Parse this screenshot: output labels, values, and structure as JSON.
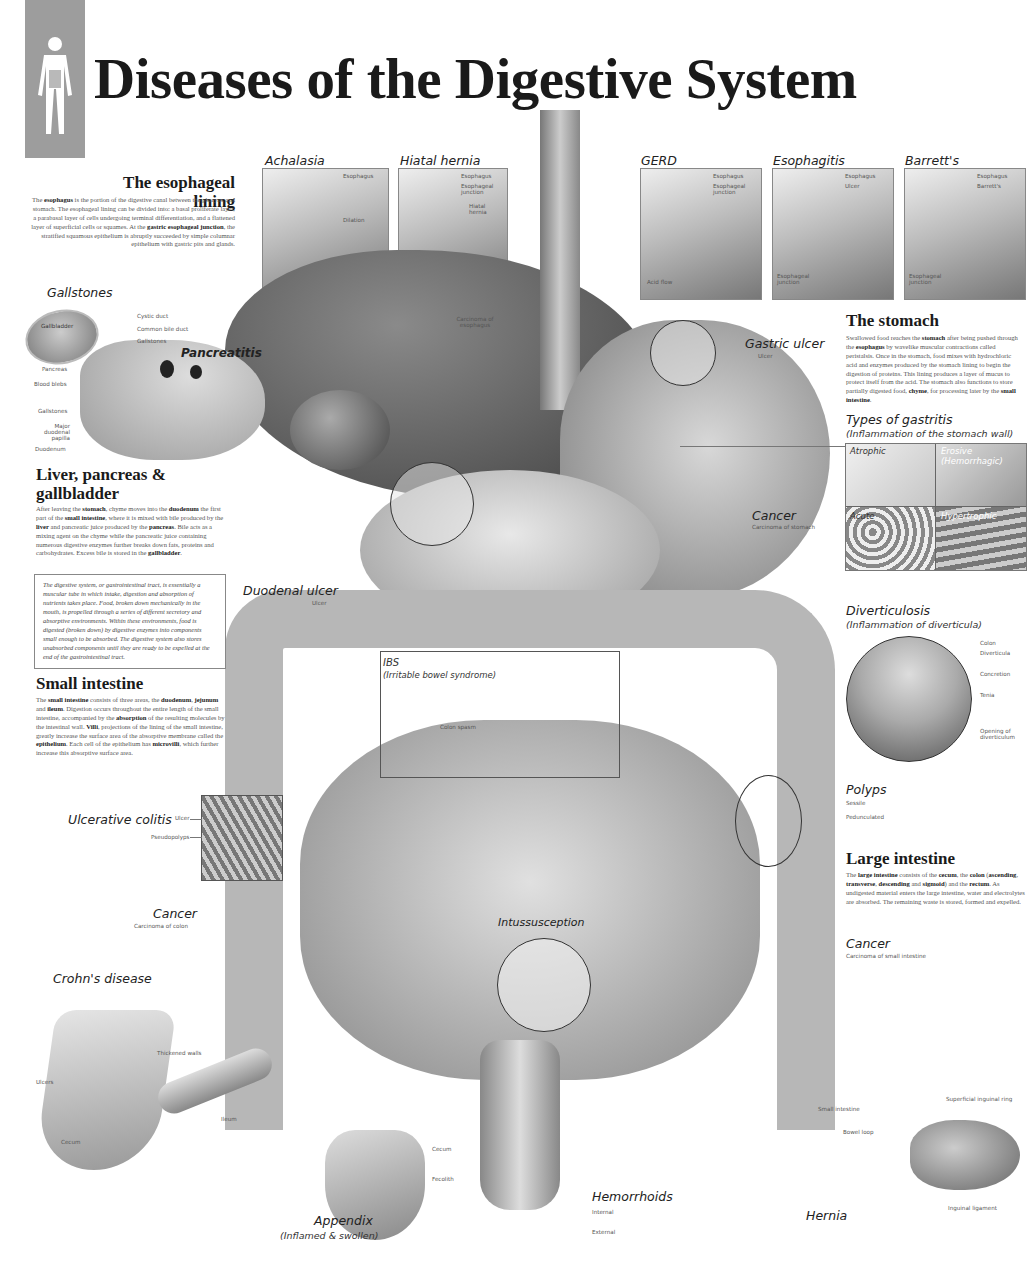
{
  "header": {
    "title": "Diseases of the Digestive System",
    "logo_icon": "human-body-silhouette-icon"
  },
  "esophageal_lining": {
    "heading": "The esophageal lining",
    "body_parts": [
      {
        "t": "The "
      },
      {
        "b": "esophagus"
      },
      {
        "t": " is the portion of the digestive canal between the pharynx and stomach. The esophageal lining can be divided into: a basal proliferate layer, a parabasal layer of cells undergoing terminal differentiation, and a flattened layer of superficial cells or squames. At the "
      },
      {
        "b": "gastric esophageal junction"
      },
      {
        "t": ", the stratified squamous epithelium is abruptly succeeded by simple columnar epithelium with gastric pits and glands."
      }
    ]
  },
  "top_panels": [
    {
      "title": "Achalasia",
      "labels": [
        "Esophagus",
        "Dilation",
        "Muscle constriction",
        "Esophageal junction"
      ]
    },
    {
      "title": "Hiatal hernia",
      "labels": [
        "Esophagus",
        "Esophageal junction",
        "Hiatal hernia"
      ]
    },
    {
      "title": "GERD",
      "labels": [
        "Esophagus",
        "Esophageal junction",
        "Acid flow"
      ]
    },
    {
      "title": "Esophagitis",
      "labels": [
        "Esophagus",
        "Ulcer",
        "Esophageal junction"
      ]
    },
    {
      "title": "Barrett's",
      "labels": [
        "Esophagus",
        "Barrett's",
        "Esophageal junction"
      ]
    }
  ],
  "gallstones": {
    "title": "Gallstones",
    "pancreatitis": "Pancreatitis",
    "labels": {
      "gallbladder": "Gallbladder",
      "cystic_duct": "Cystic duct",
      "common_bile_duct": "Common bile duct",
      "gallstones_top": "Gallstones",
      "pancreas": "Pancreas",
      "blood_blebs": "Blood blebs",
      "gallstones_bottom": "Gallstones",
      "papilla": "Major duodenal papilla",
      "duodenum": "Duodenum"
    }
  },
  "liver_section": {
    "heading": "Liver, pancreas & gallbladder",
    "body_parts": [
      {
        "t": "After leaving the "
      },
      {
        "b": "stomach"
      },
      {
        "t": ", chyme moves into the "
      },
      {
        "b": "duodenum"
      },
      {
        "t": " the first part of the "
      },
      {
        "b": "small intestine"
      },
      {
        "t": ", where it is mixed with bile produced by the "
      },
      {
        "b": "liver"
      },
      {
        "t": " and pancreatic juice produced by the "
      },
      {
        "b": "pancreas"
      },
      {
        "t": ". Bile acts as a mixing agent on the chyme while the pancreatic juice containing numerous digestive enzymes further breaks down fats, proteins and carbohydrates. Excess bile is stored in the "
      },
      {
        "b": "gallbladder"
      },
      {
        "t": "."
      }
    ],
    "boxed_note": "The digestive system, or gastrointestinal tract, is essentially a muscular tube in which intake, digestion and absorption of nutrients takes place. Food, broken down mechanically in the mouth, is propelled through a series of different secretory and absorptive environments. Within these environments, food is digested (broken down) by digestive enzymes into components small enough to be absorbed. The digestive system also stores unabsorbed components until they are ready to be expelled at the end of the gastrointestinal tract."
  },
  "small_intestine": {
    "heading": "Small intestine",
    "body_parts": [
      {
        "t": "The "
      },
      {
        "b": "small intestine"
      },
      {
        "t": " consists of three areas, the "
      },
      {
        "b": "duodenum"
      },
      {
        "t": ", "
      },
      {
        "b": "jejunum"
      },
      {
        "t": " and "
      },
      {
        "b": "ileum"
      },
      {
        "t": ". Digestion occurs throughout the entire length of the small intestine, accompanied by the "
      },
      {
        "b": "absorption"
      },
      {
        "t": " of the resulting molecules by the intestinal wall. "
      },
      {
        "b": "Villi"
      },
      {
        "t": ", projections of the lining of the small intestine, greatly increase the surface area of the absorptive membrane called the "
      },
      {
        "b": "epithelium"
      },
      {
        "t": ". Each cell of the epithelium has "
      },
      {
        "b": "microvilli"
      },
      {
        "t": ", which further increase this absorptive surface area."
      }
    ]
  },
  "stomach": {
    "heading": "The stomach",
    "body_parts": [
      {
        "t": "Swallowed food reaches the "
      },
      {
        "b": "stomach"
      },
      {
        "t": " after being pushed through the "
      },
      {
        "b": "esophagus"
      },
      {
        "t": " by wavelike muscular contractions called peristalsis. Once in the stomach, food mixes with hydrochloric acid and enzymes produced by the stomach lining to begin the digestion of proteins. This lining produces a layer of mucus to protect itself from the acid. The stomach also functions to store partially digested food, "
      },
      {
        "b": "chyme"
      },
      {
        "t": ", for processing later by the "
      },
      {
        "b": "small intestine"
      },
      {
        "t": "."
      }
    ]
  },
  "gastritis": {
    "title": "Types of gastritis",
    "subtitle": "(Inflammation of the stomach wall)",
    "cells": [
      "Atrophic",
      "Erosive (Hemorrhagic)",
      "Acute",
      "Hypertrophic"
    ]
  },
  "center_labels": {
    "carcinoma_esophagus": "Carcinoma of esophagus",
    "gastric_ulcer": "Gastric ulcer",
    "gastric_ulcer_sub": "Ulcer",
    "stomach_cancer": "Cancer",
    "stomach_cancer_sub": "Carcinoma of stomach",
    "duodenal_ulcer": "Duodenal ulcer",
    "duodenal_ulcer_sub": "Ulcer",
    "ibs": "IBS",
    "ibs_sub": "(Irritable bowel syndrome)",
    "colon_spasm": "Colon spasm",
    "intussusception": "Intussusception"
  },
  "diverticulosis": {
    "title": "Diverticulosis",
    "subtitle": "(Inflammation of diverticula)",
    "labels": [
      "Colon",
      "Diverticula",
      "Concretion",
      "Tenia",
      "Opening of diverticulum"
    ]
  },
  "polyps": {
    "title": "Polyps",
    "labels": [
      "Sessile",
      "Pedunculated"
    ]
  },
  "large_intestine": {
    "heading": "Large intestine",
    "body_parts": [
      {
        "t": "The "
      },
      {
        "b": "large intestine"
      },
      {
        "t": " consists of the "
      },
      {
        "b": "cecum"
      },
      {
        "t": ", the "
      },
      {
        "b": "colon"
      },
      {
        "t": " ("
      },
      {
        "b": "ascending"
      },
      {
        "t": ", "
      },
      {
        "b": "transverse"
      },
      {
        "t": ", "
      },
      {
        "b": "descending"
      },
      {
        "t": " and "
      },
      {
        "b": "sigmoid"
      },
      {
        "t": ") and the "
      },
      {
        "b": "rectum"
      },
      {
        "t": ". As undigested material enters the large intestine, water and electrolytes are absorbed. The remaining waste is stored, formed and expelled."
      }
    ]
  },
  "small_intestine_cancer": {
    "title": "Cancer",
    "sub": "Carcinoma of small intestine"
  },
  "ulcerative_colitis": {
    "title": "Ulcerative colitis",
    "labels": [
      "Ulcer",
      "Pseudopolyps"
    ]
  },
  "colon_cancer": {
    "title": "Cancer",
    "sub": "Carcinoma of colon"
  },
  "crohns": {
    "title": "Crohn's disease",
    "labels": [
      "Thickened walls",
      "Ulcers",
      "Ileum",
      "Cecum"
    ]
  },
  "appendix": {
    "title": "Appendix",
    "subtitle": "(Inflamed & swollen)",
    "labels": [
      "Cecum",
      "Fecolith"
    ]
  },
  "hemorrhoids": {
    "title": "Hemorrhoids",
    "labels": [
      "Internal",
      "External"
    ]
  },
  "hernia": {
    "title": "Hernia",
    "labels": [
      "Superficial inguinal ring",
      "Small intestine",
      "Bowel loop",
      "Inguinal ligament"
    ]
  },
  "colors": {
    "ink": "#1a1a1a",
    "body_text": "#555555",
    "logo_bg": "#9d9d9d",
    "organ_dark": "#555555",
    "organ_light": "#c8c8c8"
  }
}
